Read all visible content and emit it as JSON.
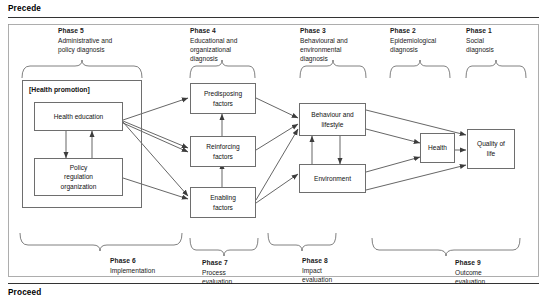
{
  "figure": {
    "top_rule_label": "Precede",
    "bottom_rule_label": "Proceed"
  },
  "top_phases": [
    {
      "number": "Phase 5",
      "description": "Administrative and\npolicy diagnosis",
      "lines": [
        "Administrative and",
        "policy diagnosis"
      ]
    },
    {
      "number": "Phase 4",
      "description": "Educational and\norganizational\ndiagnosis",
      "lines": [
        "Educational and",
        "organizational",
        "diagnosis"
      ]
    },
    {
      "number": "Phase 3",
      "description": "Behavioural and\nenvironmental\ndiagnosis",
      "lines": [
        "Behavioural and",
        "environmental",
        "diagnosis"
      ]
    },
    {
      "number": "Phase 2",
      "description": "Epidemiological\ndiagnosis",
      "lines": [
        "Epidemiological",
        "diagnosis"
      ]
    },
    {
      "number": "Phase 1",
      "description": "Social\ndiagnosis",
      "lines": [
        "Social",
        "diagnosis"
      ]
    }
  ],
  "bottom_phases": [
    {
      "number": "Phase 6",
      "description": "Implementation",
      "lines": [
        "Implementation"
      ]
    },
    {
      "number": "Phase 7",
      "description": "Process\nevaluation",
      "lines": [
        "Process",
        "evaluation"
      ]
    },
    {
      "number": "Phase 8",
      "description": "Impact\nevaluation",
      "lines": [
        "Impact",
        "evaluation"
      ]
    },
    {
      "number": "Phase 9",
      "description": "Outcome\nevaluation",
      "lines": [
        "Outcome",
        "evaluation"
      ]
    }
  ],
  "nodes": {
    "health_promotion": {
      "label": "[Health promotion]"
    },
    "health_education": {
      "label": "Health education",
      "lines": [
        "Health education"
      ]
    },
    "policy_regulation": {
      "label": "Policy regulation organization",
      "lines": [
        "Policy",
        "regulation",
        "organization"
      ]
    },
    "predisposing": {
      "label": "Predisposing factors",
      "lines": [
        "Predisposing",
        "factors"
      ]
    },
    "reinforcing": {
      "label": "Reinforcing factors",
      "lines": [
        "Reinforcing",
        "factors"
      ]
    },
    "enabling": {
      "label": "Enabling factors",
      "lines": [
        "Enabling",
        "factors"
      ]
    },
    "behaviour": {
      "label": "Behaviour and lifestyle",
      "lines": [
        "Behaviour and",
        "lifestyle"
      ]
    },
    "environment": {
      "label": "Environment",
      "lines": [
        "Environment"
      ]
    },
    "health": {
      "label": "Health",
      "lines": [
        "Health"
      ]
    },
    "quality_of_life": {
      "label": "Quality of life",
      "lines": [
        "Quality of",
        "life"
      ]
    }
  },
  "colors": {
    "stroke": "#6e6e6e",
    "arrow": "#4a4a4a",
    "text": "#111111",
    "rule": "#333333"
  }
}
